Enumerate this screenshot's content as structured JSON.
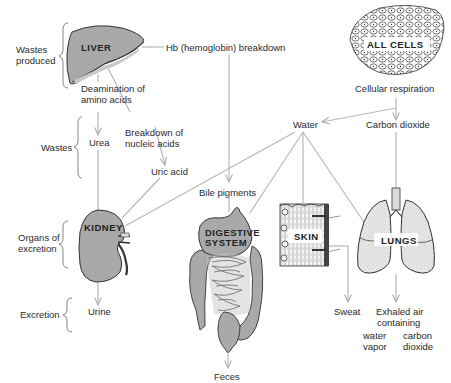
{
  "diagram": {
    "side_labels": {
      "wastes_produced": "Wastes produced",
      "wastes_produced_l1": "Wastes",
      "wastes_produced_l2": "produced",
      "wastes": "Wastes",
      "organs_of_excretion_l1": "Organs of",
      "organs_of_excretion_l2": "excretion",
      "excretion": "Excretion"
    },
    "organs": {
      "liver": "LIVER",
      "all_cells": "ALL CELLS",
      "kidney": "KIDNEY",
      "digestive_l1": "DIGESTIVE",
      "digestive_l2": "SYSTEM",
      "skin": "SKIN",
      "lungs": "LUNGS"
    },
    "processes": {
      "hb_breakdown": "Hb (hemoglobin) breakdown",
      "deamination_l1": "Deamination of",
      "deamination_l2": "amino acids",
      "nucleic_l1": "Breakdown of",
      "nucleic_l2": "nucleic acids",
      "cellular_respiration": "Cellular respiration"
    },
    "wastes": {
      "urea": "Urea",
      "uric_acid": "Uric acid",
      "bile_pigments": "Bile pigments",
      "water": "Water",
      "carbon_dioxide": "Carbon dioxide"
    },
    "outputs": {
      "urine": "Urine",
      "feces": "Feces",
      "sweat": "Sweat",
      "exhaled_l1": "Exhaled air",
      "exhaled_l2": "containing",
      "water_vapor_l1": "water",
      "water_vapor_l2": "vapor",
      "co2_l1": "carbon",
      "co2_l2": "dioxide"
    },
    "colors": {
      "line": "#b8b8b8",
      "organ_fill": "#a9a9a9",
      "organ_light": "#d4d4d4",
      "text": "#2a2a2a"
    }
  }
}
